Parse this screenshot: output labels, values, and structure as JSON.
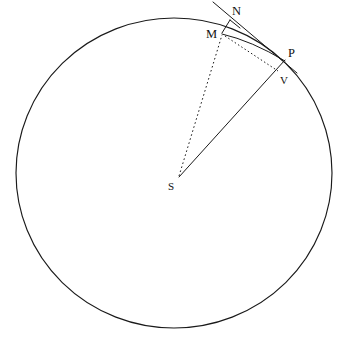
{
  "figure": {
    "background_color": "#ffffff",
    "stroke_color": "#1a1a1a",
    "width": 345,
    "height": 341
  },
  "circle": {
    "name": "main-circle",
    "center": {
      "x": 174,
      "y": 173,
      "label": "S"
    },
    "radius": 157,
    "style": "solid"
  },
  "points": [
    {
      "id": "M",
      "label": "M",
      "x": 222,
      "y": 33,
      "label_x": 206,
      "label_y": 38,
      "on_circle": true
    },
    {
      "id": "N",
      "label": "N",
      "x": 229,
      "y": 21,
      "label_x": 232,
      "label_y": 15,
      "on_circle": false
    },
    {
      "id": "P",
      "label": "P",
      "x": 283,
      "y": 61,
      "label_x": 288,
      "label_y": 57,
      "on_circle": true
    },
    {
      "id": "V",
      "label": "V",
      "x": 277,
      "y": 71,
      "label_x": 280,
      "label_y": 84,
      "on_circle": false
    },
    {
      "id": "S",
      "label": "S",
      "x": 179,
      "y": 177,
      "label_x": 168,
      "label_y": 190,
      "on_circle": false
    }
  ],
  "segments": [
    {
      "id": "tangent-line",
      "from": "upper-left",
      "to": "P-extended",
      "style": "solid",
      "x1": 213,
      "y1": 2,
      "x2": 297,
      "y2": 73
    },
    {
      "id": "tangent-arc-chord",
      "from": "M",
      "to": "P",
      "style": "solid",
      "x1": 222,
      "y1": 33,
      "x2": 284,
      "y2": 62
    },
    {
      "id": "segment-M-N",
      "from": "M",
      "to": "N",
      "style": "solid",
      "x1": 222,
      "y1": 33,
      "x2": 230,
      "y2": 21
    },
    {
      "id": "segment-N-tangent",
      "from": "N",
      "to": "tangent",
      "style": "solid",
      "x1": 230,
      "y1": 21,
      "x2": 241,
      "y2": 28
    },
    {
      "id": "radius-S-P",
      "from": "S",
      "to": "P",
      "style": "solid",
      "x1": 179,
      "y1": 177,
      "x2": 285,
      "y2": 60
    },
    {
      "id": "radius-S-M",
      "from": "S",
      "to": "M",
      "style": "dotted",
      "x1": 179,
      "y1": 177,
      "x2": 222,
      "y2": 34
    },
    {
      "id": "chord-M-V",
      "from": "M",
      "to": "V",
      "style": "dotted",
      "x1": 224,
      "y1": 35,
      "x2": 278,
      "y2": 71
    }
  ],
  "labels": {
    "M": "M",
    "N": "N",
    "P": "P",
    "V": "V",
    "S": "S"
  }
}
